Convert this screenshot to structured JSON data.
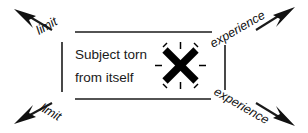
{
  "diagram": {
    "title_text_line1": "Subject torn",
    "title_text_line2": "from itself",
    "labels": {
      "top_left": "limit",
      "bottom_left": "limit",
      "top_right": "experience",
      "bottom_right": "experience"
    },
    "icons": {
      "burst": "x-burst-icon",
      "arrow_top_left": "arrow-up-left-icon",
      "arrow_top_right": "arrow-up-right-icon",
      "arrow_bottom_left": "arrow-down-left-icon",
      "arrow_bottom_right": "arrow-down-right-icon"
    },
    "colors": {
      "ink": "#1a1a1a",
      "background": "#ffffff",
      "burst": "#000000"
    }
  }
}
